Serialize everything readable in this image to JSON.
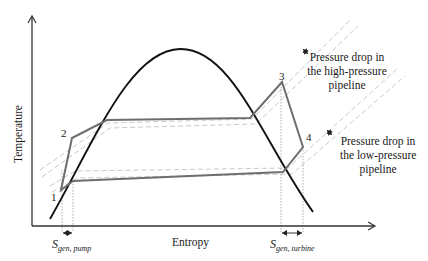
{
  "diagram": {
    "type": "T-s diagram (Rankine cycle with pipeline pressure drops)",
    "axes": {
      "x_label": "Entropy",
      "y_label": "Temperature"
    },
    "state_points": [
      {
        "id": "1",
        "label": "1"
      },
      {
        "id": "2",
        "label": "2"
      },
      {
        "id": "3",
        "label": "3"
      },
      {
        "id": "4",
        "label": "4"
      }
    ],
    "entropy_generation": {
      "pump": {
        "symbol": "S",
        "subscript": "gen, pump"
      },
      "turbine": {
        "symbol": "S",
        "subscript": "gen, turbine"
      }
    },
    "annotations": {
      "high_pressure": [
        "Pressure drop in",
        "the high-pressure",
        "pipeline"
      ],
      "low_pressure": [
        "Pressure drop in",
        "the low-pressure",
        "pipeline"
      ]
    },
    "colors": {
      "dome": "#111111",
      "cycle": "#6e6e6e",
      "isobar": "#c8c8c8",
      "axis": "#333333",
      "guide": "#9a9a9a"
    }
  }
}
